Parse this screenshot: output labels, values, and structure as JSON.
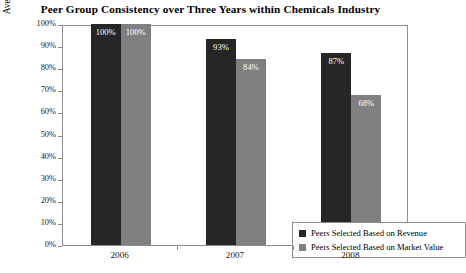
{
  "chart_data": {
    "type": "bar",
    "title": "Peer Group Consistency over Three Years within Chemicals Industry",
    "xlabel": "",
    "ylabel": "Average Percent of Original Peers Remaining",
    "categories": [
      "2006",
      "2007",
      "2008"
    ],
    "series": [
      {
        "name": "Peers Selected Based on Revenue",
        "color": "#262626",
        "values": [
          100,
          93,
          87
        ],
        "labels": [
          "100%",
          "93%",
          "87%"
        ]
      },
      {
        "name": "Peers Selected Based on Market Value",
        "color": "#808080",
        "values": [
          100,
          84,
          68
        ],
        "labels": [
          "100%",
          "84%",
          "68%"
        ]
      }
    ],
    "ylim": [
      0,
      100
    ],
    "yticks": [
      0,
      10,
      20,
      30,
      40,
      50,
      60,
      70,
      80,
      90,
      100
    ],
    "ytick_labels": [
      "0%",
      "10%",
      "20%",
      "30%",
      "40%",
      "50%",
      "60%",
      "70%",
      "80%",
      "90%",
      "100%"
    ],
    "grid": false,
    "legend_position": "inside-bottom-right"
  },
  "legend": {
    "entries": [
      {
        "label": "Peers Selected Based on Revenue",
        "color": "#262626"
      },
      {
        "label": "Peers Selected Based on Market Value",
        "color": "#808080"
      }
    ]
  },
  "colors": {
    "revenue": "#262626",
    "market_value": "#808080",
    "axis": "#8c8c8c",
    "background": "#ffffff",
    "text": "#111111"
  }
}
